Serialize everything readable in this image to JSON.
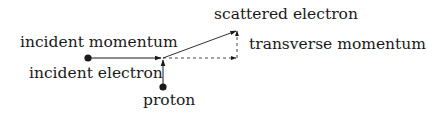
{
  "diagram": {
    "type": "momentum-vector-diagram",
    "labels": {
      "incident_momentum": "incident momentum",
      "incident_electron": "incident electron",
      "scattered_electron": "scattered electron",
      "transverse_momentum": "transverse momentum",
      "proton": "proton"
    },
    "nodes": [
      {
        "id": "incident-electron",
        "label": "incident electron",
        "x": 88,
        "y": 58
      },
      {
        "id": "proton",
        "label": "proton",
        "x": 163,
        "y": 87
      },
      {
        "id": "vertex",
        "x": 163,
        "y": 58
      }
    ],
    "edges": [
      {
        "id": "incident-momentum",
        "from": "incident-electron",
        "to": "vertex",
        "style": "solid",
        "arrow": true
      },
      {
        "id": "proton-momentum",
        "from": "proton",
        "to": "vertex",
        "style": "solid",
        "arrow": true
      },
      {
        "id": "scattered-electron",
        "from": "vertex",
        "to": [
          237,
          30
        ],
        "style": "solid",
        "arrow": true
      },
      {
        "id": "longitudinal-component",
        "from": "vertex",
        "to": [
          237,
          58
        ],
        "style": "dashed",
        "arrow": true
      },
      {
        "id": "transverse-component",
        "from": [
          237,
          58
        ],
        "to": [
          237,
          30
        ],
        "style": "dashed",
        "arrow": true
      }
    ],
    "colors": {
      "stroke": "#1a1a1a",
      "background": "#ffffff"
    }
  }
}
